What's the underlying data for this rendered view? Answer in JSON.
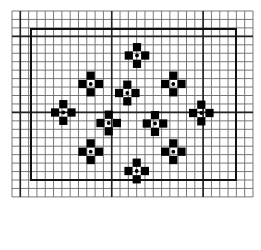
{
  "diagram": {
    "type": "grid-pattern",
    "background": "#ffffff",
    "grid": {
      "x0": 12,
      "y0": 11,
      "cols": 29,
      "rows": 22,
      "cell_w": 8.31,
      "cell_h": 8.45,
      "line_color": "#6a6a6a",
      "thick_cols": [
        1,
        12,
        23
      ],
      "thick_rows": [
        3,
        12
      ],
      "thick_color": "#222222"
    },
    "frame": {
      "left": 31,
      "top": 29,
      "right": 236,
      "bottom": 180,
      "color": "#111111",
      "width": 2
    },
    "motif_color": "#000000",
    "motif_dot_color": "#000000",
    "motifs": [
      {
        "x": 137.0,
        "y": 55.5
      },
      {
        "x": 90.7,
        "y": 84.0
      },
      {
        "x": 173.3,
        "y": 84.0
      },
      {
        "x": 127.3,
        "y": 93.0
      },
      {
        "x": 63.3,
        "y": 112.5
      },
      {
        "x": 201.3,
        "y": 113.0
      },
      {
        "x": 108.7,
        "y": 123.0
      },
      {
        "x": 155.0,
        "y": 123.5
      },
      {
        "x": 90.7,
        "y": 151.7
      },
      {
        "x": 173.3,
        "y": 151.7
      },
      {
        "x": 136.7,
        "y": 171.0
      }
    ]
  }
}
